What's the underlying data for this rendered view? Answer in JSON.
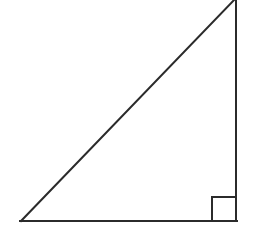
{
  "figure": {
    "kind": "geometry-diagram",
    "background_color": "#ffffff",
    "stroke_color": "#2b2b2b",
    "stroke_width": 2,
    "canvas": {
      "width": 256,
      "height": 239
    },
    "vertices": [
      {
        "name": "apex",
        "x": 236,
        "y": 0,
        "note": "clipped at top edge of image"
      },
      {
        "name": "bottom-left",
        "x": 21,
        "y": 221
      },
      {
        "name": "bottom-right",
        "x": 236,
        "y": 221
      }
    ],
    "edges": [
      {
        "name": "hypotenuse",
        "from": "bottom-left",
        "to": "apex"
      },
      {
        "name": "base",
        "from": "bottom-left",
        "to": "bottom-right"
      },
      {
        "name": "vertical-leg",
        "from": "bottom-right",
        "to": "apex"
      }
    ],
    "right_angle_marker": {
      "name": "right-angle-square",
      "at_vertex": "bottom-right",
      "x": 212,
      "y": 197,
      "size": 24
    },
    "labels": []
  }
}
